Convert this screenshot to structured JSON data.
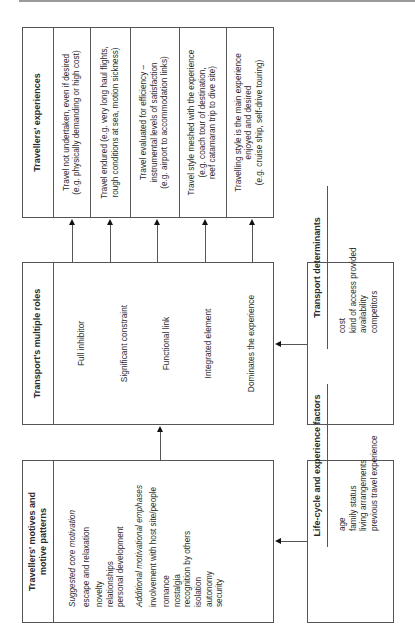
{
  "experiences": {
    "title": "Travellers' experiences",
    "rows": [
      {
        "line1": "Travel not undertaken, even if desired",
        "line2": "(e.g. physically demanding or high cost)",
        "line3": ""
      },
      {
        "line1": "Travel endured (e.g. very long haul flights,",
        "line2": "rough conditions at sea, motion sickness)",
        "line3": ""
      },
      {
        "line1": "Travel evaluated for efficiency –",
        "line2": "instrumental levels of satisfaction",
        "line3": "(e.g. airport to accommodation links)"
      },
      {
        "line1": "Travel style meshed with the experience",
        "line2": "(e.g. coach tour of destination,",
        "line3": "reef catamaran trip to dive site)"
      },
      {
        "line1": "Travelling style is the main experience",
        "line2": "enjoyed and desired",
        "line3": "(e.g. cruise ship, self-drive touring)"
      }
    ]
  },
  "roles": {
    "title": "Transport's multiple roles",
    "items": [
      "Full inhibitor",
      "Significant constraint",
      "Functional link",
      "Integrated element",
      "Dominates the experience"
    ]
  },
  "motives": {
    "title_line1": "Travellers' motives and",
    "title_line2": "motive patterns",
    "core_heading": "Suggested core motivation",
    "core_items": [
      "escape and relaxation",
      "novelty",
      "relationships",
      "personal development"
    ],
    "additional_heading": "Additional motivational emphases",
    "additional_items": [
      "involvement with host site/people",
      "romance",
      "nostalgia",
      "recognition by others",
      "isolation",
      "autonomy",
      "security"
    ]
  },
  "determinants": {
    "title": "Transport determinants",
    "items": [
      "cost",
      "kind of access provided",
      "availability",
      "competitors"
    ]
  },
  "lifecycle": {
    "title": "Life-cycle and experience factors",
    "items": [
      "age",
      "family status",
      "living arrangements",
      "previous travel experience"
    ]
  }
}
